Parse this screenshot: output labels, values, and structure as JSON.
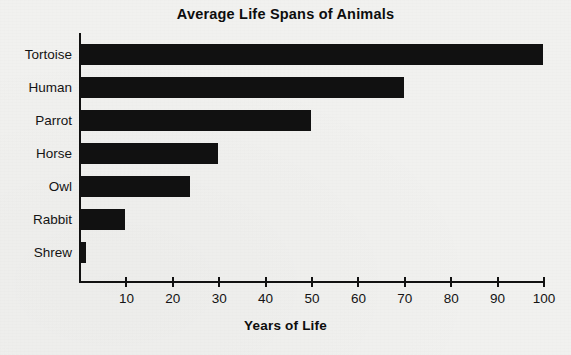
{
  "chart_data": {
    "type": "bar",
    "orientation": "horizontal",
    "title": "Average Life Spans of Animals",
    "xlabel": "Years of Life",
    "ylabel": "",
    "categories": [
      "Tortoise",
      "Human",
      "Parrot",
      "Horse",
      "Owl",
      "Rabbit",
      "Shrew"
    ],
    "values": [
      100,
      70,
      50,
      30,
      24,
      10,
      1.5
    ],
    "xlim": [
      0,
      100
    ],
    "xticks": [
      10,
      20,
      30,
      40,
      50,
      60,
      70,
      80,
      90,
      100
    ],
    "xtick_labels": [
      "10",
      "20",
      "30",
      "40",
      "50",
      "60",
      "70",
      "80",
      "90",
      "100"
    ],
    "grid": false,
    "legend": null,
    "bar_color": "#111111",
    "background_color": "#f1f1ef",
    "axis_color": "#111111"
  }
}
